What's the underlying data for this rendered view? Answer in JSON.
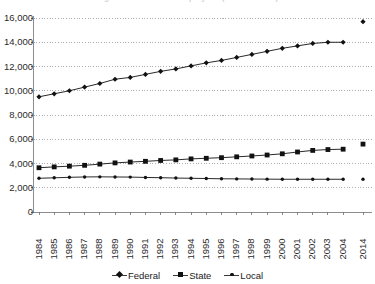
{
  "chart_data": {
    "type": "line",
    "title": "Figure 1. Number of Employees (in thousands)",
    "xlabel": "",
    "ylabel": "",
    "ylim": [
      0,
      16000
    ],
    "yticks": [
      0,
      2000,
      4000,
      6000,
      8000,
      10000,
      12000,
      14000,
      16000
    ],
    "ytick_labels": [
      "0",
      "2,000",
      "4,000",
      "6,000",
      "8,000",
      "10,000",
      "12,000",
      "14,000",
      "16,000"
    ],
    "grid": true,
    "grid_style": "dotted-horizontal",
    "legend_position": "bottom",
    "categories": [
      "1984",
      "1985",
      "1986",
      "1987",
      "1988",
      "1989",
      "1990",
      "1991",
      "1992",
      "1993",
      "1994",
      "1995",
      "1996",
      "1997",
      "1998",
      "1999",
      "2000",
      "2001",
      "2002",
      "2003",
      "2004",
      "2014"
    ],
    "gap_before_last_category": true,
    "series": [
      {
        "name": "Federal",
        "marker": "diamond",
        "color": "#111111",
        "values": [
          9500,
          9750,
          10000,
          10300,
          10600,
          10950,
          11100,
          11350,
          11600,
          11800,
          12050,
          12300,
          12500,
          12750,
          13000,
          13250,
          13500,
          13700,
          13900,
          14000,
          14000,
          15700
        ],
        "last_point_disconnected": true
      },
      {
        "name": "State",
        "marker": "square",
        "color": "#111111",
        "values": [
          3650,
          3720,
          3780,
          3850,
          3950,
          4050,
          4120,
          4180,
          4250,
          4300,
          4380,
          4430,
          4480,
          4550,
          4620,
          4700,
          4800,
          4950,
          5080,
          5150,
          5180,
          5600
        ],
        "last_point_disconnected": true
      },
      {
        "name": "Local",
        "marker": "dot",
        "color": "#111111",
        "values": [
          2780,
          2820,
          2860,
          2890,
          2900,
          2890,
          2880,
          2850,
          2830,
          2800,
          2780,
          2760,
          2740,
          2730,
          2720,
          2710,
          2700,
          2700,
          2700,
          2700,
          2700,
          2700
        ],
        "last_point_disconnected": true
      }
    ]
  },
  "legend": {
    "items": [
      {
        "label": "Federal",
        "marker": "diamond"
      },
      {
        "label": "State",
        "marker": "square"
      },
      {
        "label": "Local",
        "marker": "dot"
      }
    ]
  }
}
